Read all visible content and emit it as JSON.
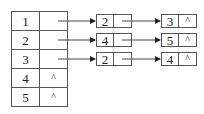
{
  "diagram": {
    "type": "adjacency-list",
    "head_table": [
      {
        "index": "1",
        "pointer": ""
      },
      {
        "index": "2",
        "pointer": ""
      },
      {
        "index": "3",
        "pointer": ""
      },
      {
        "index": "4",
        "pointer": "^"
      },
      {
        "index": "5",
        "pointer": "^"
      }
    ],
    "lists": [
      {
        "row": 0,
        "nodes": [
          {
            "value": "2",
            "next": ""
          },
          {
            "value": "3",
            "next": "^"
          }
        ]
      },
      {
        "row": 1,
        "nodes": [
          {
            "value": "4",
            "next": ""
          },
          {
            "value": "5",
            "next": "^"
          }
        ]
      },
      {
        "row": 2,
        "nodes": [
          {
            "value": "2",
            "next": ""
          },
          {
            "value": "4",
            "next": "^"
          }
        ]
      }
    ]
  }
}
